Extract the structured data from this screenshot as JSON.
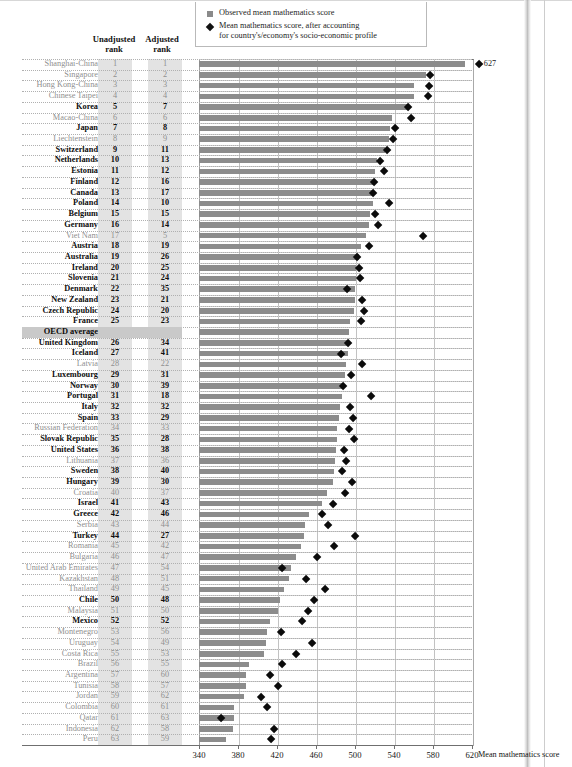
{
  "legend": {
    "items": [
      {
        "icon": "square-marker-icon",
        "label": "Observed mean mathematics score"
      },
      {
        "icon": "diamond-marker-icon",
        "label": "Mean mathematics score, after accounting for country's/economy's socio-economic profile"
      }
    ],
    "item2_line1": "Mean mathematics score, after accounting",
    "item2_line2": "for country's/economy's socio-economic profile"
  },
  "columns": {
    "unadjusted_line1": "Unadjusted",
    "unadjusted_line2": "rank",
    "adjusted_line1": "Adjusted",
    "adjusted_line2": "rank"
  },
  "axis": {
    "title": "Mean mathematics score",
    "ticks": [
      340,
      380,
      420,
      460,
      500,
      540,
      580,
      620
    ],
    "min": 340,
    "max": 620
  },
  "annotations": {
    "shanghai_adjusted_value": "627"
  },
  "colors": {
    "bar": "#8c8c8c",
    "diamond": "#0b0b0b",
    "rank_shade": "#e3e3e3",
    "average_band": "#c9c9c9",
    "oecd_member_text": "#0d0d0d",
    "partner_text": "#8f8f8f"
  },
  "chart_data": {
    "type": "bar",
    "title": "",
    "xlabel": "Mean mathematics score",
    "ylabel": "",
    "xlim": [
      340,
      620
    ],
    "grid": true,
    "legend_position": "top",
    "series": [
      {
        "name": "Observed mean mathematics score",
        "type": "bar"
      },
      {
        "name": "Mean mathematics score, after accounting for country's/economy's socio-economic profile",
        "type": "diamond-marker"
      }
    ],
    "categories": [
      "Shanghai-China",
      "Singapore",
      "Hong Kong-China",
      "Chinese Taipei",
      "Korea",
      "Macao-China",
      "Japan",
      "Liechtenstein",
      "Switzerland",
      "Netherlands",
      "Estonia",
      "Finland",
      "Canada",
      "Poland",
      "Belgium",
      "Germany",
      "Viet Nam",
      "Austria",
      "Australia",
      "Ireland",
      "Slovenia",
      "Denmark",
      "New Zealand",
      "Czech Republic",
      "France",
      "OECD average",
      "United Kingdom",
      "Iceland",
      "Latvia",
      "Luxembourg",
      "Norway",
      "Portugal",
      "Italy",
      "Spain",
      "Russian Federation",
      "Slovak Republic",
      "United States",
      "Lithuania",
      "Sweden",
      "Hungary",
      "Croatia",
      "Israel",
      "Greece",
      "Serbia",
      "Turkey",
      "Romania",
      "Bulgaria",
      "United Arab Emirates",
      "Kazakhstan",
      "Thailand",
      "Chile",
      "Malaysia",
      "Mexico",
      "Montenegro",
      "Uruguay",
      "Costa Rica",
      "Brazil",
      "Argentina",
      "Tunisia",
      "Jordan",
      "Colombia",
      "Qatar",
      "Indonesia",
      "Peru"
    ],
    "rows": [
      {
        "country": "Shanghai-China",
        "unadjusted": "1",
        "adjusted": "1",
        "observed": 613,
        "adjusted_score": 627,
        "oecd": false
      },
      {
        "country": "Singapore",
        "unadjusted": "2",
        "adjusted": "2",
        "observed": 573,
        "adjusted_score": 577,
        "oecd": false
      },
      {
        "country": "Hong Kong-China",
        "unadjusted": "3",
        "adjusted": "3",
        "observed": 561,
        "adjusted_score": 576,
        "oecd": false
      },
      {
        "country": "Chinese Taipei",
        "unadjusted": "4",
        "adjusted": "4",
        "observed": 560,
        "adjusted_score": 575,
        "oecd": false
      },
      {
        "country": "Korea",
        "unadjusted": "5",
        "adjusted": "7",
        "observed": 554,
        "adjusted_score": 554,
        "oecd": true
      },
      {
        "country": "Macao-China",
        "unadjusted": "6",
        "adjusted": "6",
        "observed": 538,
        "adjusted_score": 558,
        "oecd": false
      },
      {
        "country": "Japan",
        "unadjusted": "7",
        "adjusted": "8",
        "observed": 536,
        "adjusted_score": 541,
        "oecd": true
      },
      {
        "country": "Liechtenstein",
        "unadjusted": "8",
        "adjusted": "9",
        "observed": 535,
        "adjusted_score": 539,
        "oecd": false
      },
      {
        "country": "Switzerland",
        "unadjusted": "9",
        "adjusted": "11",
        "observed": 531,
        "adjusted_score": 533,
        "oecd": true
      },
      {
        "country": "Netherlands",
        "unadjusted": "10",
        "adjusted": "13",
        "observed": 523,
        "adjusted_score": 526,
        "oecd": true
      },
      {
        "country": "Estonia",
        "unadjusted": "11",
        "adjusted": "12",
        "observed": 521,
        "adjusted_score": 530,
        "oecd": true
      },
      {
        "country": "Finland",
        "unadjusted": "12",
        "adjusted": "16",
        "observed": 519,
        "adjusted_score": 520,
        "oecd": true
      },
      {
        "country": "Canada",
        "unadjusted": "13",
        "adjusted": "17",
        "observed": 518,
        "adjusted_score": 519,
        "oecd": true
      },
      {
        "country": "Poland",
        "unadjusted": "14",
        "adjusted": "10",
        "observed": 518,
        "adjusted_score": 535,
        "oecd": true
      },
      {
        "country": "Belgium",
        "unadjusted": "15",
        "adjusted": "15",
        "observed": 515,
        "adjusted_score": 521,
        "oecd": true
      },
      {
        "country": "Germany",
        "unadjusted": "16",
        "adjusted": "14",
        "observed": 514,
        "adjusted_score": 524,
        "oecd": true
      },
      {
        "country": "Viet Nam",
        "unadjusted": "17",
        "adjusted": "5",
        "observed": 511,
        "adjusted_score": 570,
        "oecd": false
      },
      {
        "country": "Austria",
        "unadjusted": "18",
        "adjusted": "19",
        "observed": 506,
        "adjusted_score": 514,
        "oecd": true
      },
      {
        "country": "Australia",
        "unadjusted": "19",
        "adjusted": "26",
        "observed": 504,
        "adjusted_score": 502,
        "oecd": true
      },
      {
        "country": "Ireland",
        "unadjusted": "20",
        "adjusted": "25",
        "observed": 501,
        "adjusted_score": 504,
        "oecd": true
      },
      {
        "country": "Slovenia",
        "unadjusted": "21",
        "adjusted": "24",
        "observed": 501,
        "adjusted_score": 505,
        "oecd": true
      },
      {
        "country": "Denmark",
        "unadjusted": "22",
        "adjusted": "35",
        "observed": 500,
        "adjusted_score": 492,
        "oecd": true
      },
      {
        "country": "New Zealand",
        "unadjusted": "23",
        "adjusted": "21",
        "observed": 500,
        "adjusted_score": 507,
        "oecd": true
      },
      {
        "country": "Czech Republic",
        "unadjusted": "24",
        "adjusted": "20",
        "observed": 499,
        "adjusted_score": 509,
        "oecd": true
      },
      {
        "country": "France",
        "unadjusted": "25",
        "adjusted": "23",
        "observed": 495,
        "adjusted_score": 506,
        "oecd": true
      },
      {
        "country": "OECD average",
        "unadjusted": "",
        "adjusted": "",
        "observed": 494,
        "adjusted_score": null,
        "oecd": true,
        "is_average": true
      },
      {
        "country": "United Kingdom",
        "unadjusted": "26",
        "adjusted": "34",
        "observed": 494,
        "adjusted_score": 493,
        "oecd": true
      },
      {
        "country": "Iceland",
        "unadjusted": "27",
        "adjusted": "41",
        "observed": 493,
        "adjusted_score": 486,
        "oecd": true
      },
      {
        "country": "Latvia",
        "unadjusted": "28",
        "adjusted": "22",
        "observed": 491,
        "adjusted_score": 507,
        "oecd": false
      },
      {
        "country": "Luxembourg",
        "unadjusted": "29",
        "adjusted": "31",
        "observed": 490,
        "adjusted_score": 496,
        "oecd": true
      },
      {
        "country": "Norway",
        "unadjusted": "30",
        "adjusted": "39",
        "observed": 489,
        "adjusted_score": 488,
        "oecd": true
      },
      {
        "country": "Portugal",
        "unadjusted": "31",
        "adjusted": "18",
        "observed": 487,
        "adjusted_score": 516,
        "oecd": true
      },
      {
        "country": "Italy",
        "unadjusted": "32",
        "adjusted": "32",
        "observed": 485,
        "adjusted_score": 495,
        "oecd": true
      },
      {
        "country": "Spain",
        "unadjusted": "33",
        "adjusted": "29",
        "observed": 484,
        "adjusted_score": 498,
        "oecd": true
      },
      {
        "country": "Russian Federation",
        "unadjusted": "34",
        "adjusted": "33",
        "observed": 482,
        "adjusted_score": 494,
        "oecd": false
      },
      {
        "country": "Slovak Republic",
        "unadjusted": "35",
        "adjusted": "28",
        "observed": 482,
        "adjusted_score": 499,
        "oecd": true
      },
      {
        "country": "United States",
        "unadjusted": "36",
        "adjusted": "38",
        "observed": 481,
        "adjusted_score": 489,
        "oecd": true
      },
      {
        "country": "Lithuania",
        "unadjusted": "37",
        "adjusted": "36",
        "observed": 479,
        "adjusted_score": 491,
        "oecd": false
      },
      {
        "country": "Sweden",
        "unadjusted": "38",
        "adjusted": "40",
        "observed": 478,
        "adjusted_score": 487,
        "oecd": true
      },
      {
        "country": "Hungary",
        "unadjusted": "39",
        "adjusted": "30",
        "observed": 477,
        "adjusted_score": 497,
        "oecd": true
      },
      {
        "country": "Croatia",
        "unadjusted": "40",
        "adjusted": "37",
        "observed": 471,
        "adjusted_score": 490,
        "oecd": false
      },
      {
        "country": "Israel",
        "unadjusted": "41",
        "adjusted": "43",
        "observed": 466,
        "adjusted_score": 478,
        "oecd": true
      },
      {
        "country": "Greece",
        "unadjusted": "42",
        "adjusted": "46",
        "observed": 453,
        "adjusted_score": 466,
        "oecd": true
      },
      {
        "country": "Serbia",
        "unadjusted": "43",
        "adjusted": "44",
        "observed": 449,
        "adjusted_score": 472,
        "oecd": false
      },
      {
        "country": "Turkey",
        "unadjusted": "44",
        "adjusted": "27",
        "observed": 448,
        "adjusted_score": 500,
        "oecd": true
      },
      {
        "country": "Romania",
        "unadjusted": "45",
        "adjusted": "42",
        "observed": 445,
        "adjusted_score": 479,
        "oecd": false
      },
      {
        "country": "Bulgaria",
        "unadjusted": "46",
        "adjusted": "47",
        "observed": 439,
        "adjusted_score": 461,
        "oecd": false
      },
      {
        "country": "United Arab Emirates",
        "unadjusted": "47",
        "adjusted": "54",
        "observed": 434,
        "adjusted_score": 425,
        "oecd": false
      },
      {
        "country": "Kazakhstan",
        "unadjusted": "48",
        "adjusted": "51",
        "observed": 432,
        "adjusted_score": 450,
        "oecd": false
      },
      {
        "country": "Thailand",
        "unadjusted": "49",
        "adjusted": "45",
        "observed": 427,
        "adjusted_score": 469,
        "oecd": false
      },
      {
        "country": "Chile",
        "unadjusted": "50",
        "adjusted": "48",
        "observed": 423,
        "adjusted_score": 458,
        "oecd": true
      },
      {
        "country": "Malaysia",
        "unadjusted": "51",
        "adjusted": "50",
        "observed": 421,
        "adjusted_score": 452,
        "oecd": false
      },
      {
        "country": "Mexico",
        "unadjusted": "52",
        "adjusted": "52",
        "observed": 413,
        "adjusted_score": 446,
        "oecd": true
      },
      {
        "country": "Montenegro",
        "unadjusted": "53",
        "adjusted": "56",
        "observed": 410,
        "adjusted_score": 424,
        "oecd": false
      },
      {
        "country": "Uruguay",
        "unadjusted": "54",
        "adjusted": "49",
        "observed": 409,
        "adjusted_score": 456,
        "oecd": false
      },
      {
        "country": "Costa Rica",
        "unadjusted": "55",
        "adjusted": "53",
        "observed": 407,
        "adjusted_score": 440,
        "oecd": false
      },
      {
        "country": "Brazil",
        "unadjusted": "56",
        "adjusted": "55",
        "observed": 391,
        "adjusted_score": 425,
        "oecd": false
      },
      {
        "country": "Argentina",
        "unadjusted": "57",
        "adjusted": "60",
        "observed": 388,
        "adjusted_score": 413,
        "oecd": false
      },
      {
        "country": "Tunisia",
        "unadjusted": "58",
        "adjusted": "57",
        "observed": 388,
        "adjusted_score": 421,
        "oecd": false
      },
      {
        "country": "Jordan",
        "unadjusted": "59",
        "adjusted": "62",
        "observed": 386,
        "adjusted_score": 404,
        "oecd": false
      },
      {
        "country": "Colombia",
        "unadjusted": "60",
        "adjusted": "61",
        "observed": 376,
        "adjusted_score": 410,
        "oecd": false
      },
      {
        "country": "Qatar",
        "unadjusted": "61",
        "adjusted": "63",
        "observed": 376,
        "adjusted_score": 363,
        "oecd": false
      },
      {
        "country": "Indonesia",
        "unadjusted": "62",
        "adjusted": "58",
        "observed": 375,
        "adjusted_score": 417,
        "oecd": false
      },
      {
        "country": "Peru",
        "unadjusted": "63",
        "adjusted": "59",
        "observed": 368,
        "adjusted_score": 414,
        "oecd": false
      }
    ]
  }
}
